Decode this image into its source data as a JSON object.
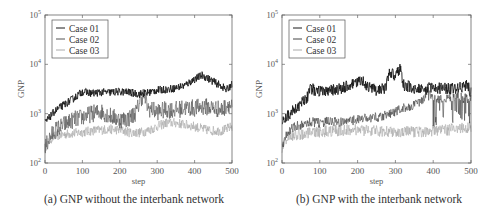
{
  "chart_data": [
    {
      "type": "line",
      "panel": "a",
      "caption": "(a) GNP without the interbank network",
      "xlabel": "step",
      "ylabel": "GNP",
      "xlim": [
        0,
        500
      ],
      "ylim": [
        100,
        100000
      ],
      "yscale": "log",
      "xticks": [
        "0",
        "100",
        "200",
        "300",
        "400",
        "500"
      ],
      "yticks": [
        {
          "base": "10",
          "exp": "2"
        },
        {
          "base": "10",
          "exp": "3"
        },
        {
          "base": "10",
          "exp": "4"
        },
        {
          "base": "10",
          "exp": "5"
        }
      ],
      "legend_position": "top-left",
      "series": [
        {
          "name": "Case 01",
          "color": "#1a1a1a",
          "x": [
            0,
            10,
            25,
            50,
            75,
            100,
            125,
            150,
            175,
            200,
            225,
            250,
            270,
            300,
            325,
            350,
            375,
            400,
            420,
            430,
            450,
            475,
            485,
            500
          ],
          "y": [
            650,
            800,
            1100,
            1500,
            2000,
            2800,
            2600,
            2700,
            2700,
            2800,
            2700,
            2500,
            2600,
            3000,
            3100,
            3300,
            3800,
            5000,
            6000,
            5500,
            4500,
            3500,
            3000,
            4000
          ],
          "noise": 0.08
        },
        {
          "name": "Case 02",
          "color": "#555555",
          "x": [
            0,
            10,
            25,
            50,
            75,
            100,
            125,
            150,
            175,
            200,
            225,
            245,
            255,
            265,
            275,
            300,
            325,
            350,
            375,
            400,
            425,
            450,
            475,
            490,
            500
          ],
          "y": [
            200,
            300,
            450,
            600,
            750,
            850,
            1000,
            1100,
            900,
            750,
            800,
            1100,
            2000,
            2500,
            1300,
            1100,
            1200,
            1200,
            1300,
            1300,
            1400,
            1300,
            1200,
            1600,
            1300
          ],
          "noise": 0.18
        },
        {
          "name": "Case 03",
          "color": "#aaaaaa",
          "x": [
            0,
            10,
            25,
            50,
            75,
            100,
            125,
            150,
            175,
            200,
            225,
            250,
            275,
            300,
            325,
            350,
            375,
            400,
            425,
            450,
            475,
            500
          ],
          "y": [
            200,
            280,
            350,
            380,
            400,
            420,
            450,
            470,
            480,
            470,
            420,
            410,
            450,
            550,
            650,
            650,
            600,
            550,
            480,
            450,
            450,
            550
          ],
          "noise": 0.1
        }
      ]
    },
    {
      "type": "line",
      "panel": "b",
      "caption": "(b) GNP with the interbank network",
      "xlabel": "step",
      "ylabel": "GNP",
      "xlim": [
        0,
        500
      ],
      "ylim": [
        100,
        100000
      ],
      "yscale": "log",
      "xticks": [
        "0",
        "100",
        "200",
        "300",
        "400",
        "500"
      ],
      "yticks": [
        {
          "base": "10",
          "exp": "2"
        },
        {
          "base": "10",
          "exp": "3"
        },
        {
          "base": "10",
          "exp": "4"
        },
        {
          "base": "10",
          "exp": "5"
        }
      ],
      "legend_position": "top-left",
      "series": [
        {
          "name": "Case 01",
          "color": "#1a1a1a",
          "x": [
            0,
            10,
            25,
            50,
            65,
            75,
            100,
            125,
            150,
            175,
            200,
            215,
            230,
            250,
            275,
            285,
            300,
            315,
            320,
            350,
            375,
            400,
            425,
            450,
            475,
            490,
            500
          ],
          "y": [
            650,
            800,
            1100,
            1600,
            2000,
            3200,
            2800,
            2900,
            3200,
            3600,
            4200,
            4800,
            3300,
            3000,
            3400,
            7000,
            6000,
            9000,
            3800,
            3300,
            3200,
            3300,
            3300,
            3200,
            3400,
            3800,
            2600
          ],
          "noise": 0.12
        },
        {
          "name": "Case 02",
          "color": "#444444",
          "x": [
            0,
            10,
            25,
            50,
            75,
            100,
            125,
            150,
            175,
            200,
            225,
            250,
            275,
            300,
            325,
            350,
            375,
            385,
            400,
            425,
            450,
            475,
            500
          ],
          "y": [
            200,
            350,
            500,
            600,
            680,
            650,
            700,
            660,
            700,
            760,
            800,
            850,
            950,
            1100,
            1300,
            1500,
            1900,
            3200,
            2000,
            2000,
            2200,
            2100,
            2000
          ],
          "noise": 0.1,
          "spiky_after": 385
        },
        {
          "name": "Case 03",
          "color": "#aaaaaa",
          "x": [
            0,
            10,
            25,
            50,
            75,
            100,
            125,
            150,
            175,
            200,
            225,
            250,
            275,
            300,
            325,
            350,
            375,
            400,
            425,
            450,
            475,
            500
          ],
          "y": [
            200,
            300,
            350,
            380,
            400,
            430,
            450,
            460,
            470,
            470,
            460,
            450,
            450,
            430,
            420,
            430,
            440,
            450,
            460,
            480,
            500,
            550
          ],
          "noise": 0.12
        }
      ]
    }
  ]
}
